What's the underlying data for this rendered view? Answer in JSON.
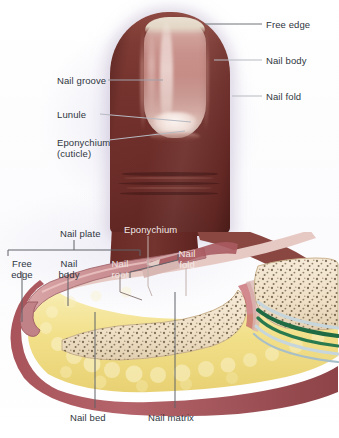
{
  "figure": {
    "panels": [
      {
        "id": "surface-view",
        "name": "Surface view of fingertip and nail"
      },
      {
        "id": "sagittal-section",
        "name": "Sagittal section through fingertip and nail"
      }
    ]
  },
  "colors": {
    "background": "#ffffff",
    "background_tint": "#dedaec",
    "label_text": "#2f3640",
    "leader_line": "#7c7f88",
    "leader_line_light": "#b9bcc4",
    "skin": "#6e2e2a",
    "skin_highlight": "#8e4a42",
    "nail_plate": "#c68c86",
    "nail_free_edge": "#e8ded0",
    "lunule": "#fbf4ef",
    "section_skin_edge": "#a9565c",
    "section_nail_plate": "#c98f92",
    "fat_tissue": "#f2e08a",
    "fat_tissue_light": "#f7ebb0",
    "bone": "#f0e2cb",
    "bone_speckle": "#4a3a24",
    "tendon": "#1f6b44",
    "sheath": "#c6d6dc",
    "dermis": "#e7c9c4"
  },
  "surface_view": {
    "labels": [
      {
        "id": "free-edge",
        "text": "Free edge",
        "side": "right"
      },
      {
        "id": "nail-body",
        "text": "Nail body",
        "side": "right"
      },
      {
        "id": "nail-fold",
        "text": "Nail fold",
        "side": "right"
      },
      {
        "id": "nail-groove",
        "text": "Nail groove",
        "side": "left"
      },
      {
        "id": "lunule",
        "text": "Lunule",
        "side": "left"
      },
      {
        "id": "eponychium",
        "text": "Eponychium",
        "text2": "(cuticle)",
        "side": "left"
      }
    ]
  },
  "sagittal_section": {
    "bracket_label": {
      "id": "nail-plate",
      "text": "Nail plate"
    },
    "labels": [
      {
        "id": "free-edge",
        "text": "Free",
        "text2": "edge"
      },
      {
        "id": "nail-body",
        "text": "Nail",
        "text2": "body"
      },
      {
        "id": "nail-root",
        "text": "Nail",
        "text2": "root"
      },
      {
        "id": "eponychium",
        "text": "Eponychium"
      },
      {
        "id": "nail-fold",
        "text": "Nail",
        "text2": "fold"
      },
      {
        "id": "nail-bed",
        "text": "Nail bed"
      },
      {
        "id": "nail-matrix",
        "text": "Nail matrix"
      }
    ]
  }
}
